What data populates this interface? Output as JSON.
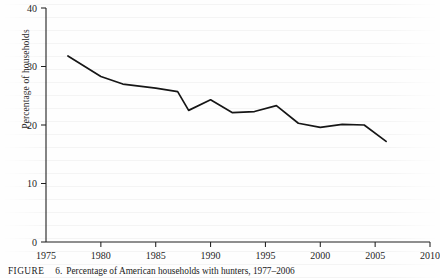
{
  "figure": {
    "caption_kicker": "FIGURE",
    "caption_number": "6.",
    "caption_text": "Percentage of American households with hunters, 1977–2006"
  },
  "chart_data": {
    "type": "line",
    "title": "",
    "subtitle": "",
    "xlabel": "",
    "ylabel": "Percentage of households",
    "xlim": [
      1975,
      2010
    ],
    "ylim": [
      0,
      40
    ],
    "grid": false,
    "legend": false,
    "legend_position": "none",
    "x_ticks": [
      "1975",
      "1980",
      "1985",
      "1990",
      "1995",
      "2000",
      "2005",
      "2010"
    ],
    "x_tick_values": [
      1975,
      1980,
      1985,
      1990,
      1995,
      2000,
      2005,
      2010
    ],
    "y_ticks": [
      "0",
      "10",
      "20",
      "30",
      "40"
    ],
    "y_tick_values": [
      0,
      10,
      20,
      30,
      40
    ],
    "series": [
      {
        "name": "Percentage of American households with hunters",
        "color": "#161616",
        "x": [
          1977,
          1980,
          1982,
          1985,
          1987,
          1988,
          1990,
          1992,
          1994,
          1996,
          1998,
          2000,
          2002,
          2004,
          2006
        ],
        "values": [
          31.8,
          28.3,
          27.0,
          26.3,
          25.7,
          22.5,
          24.3,
          22.1,
          22.3,
          23.3,
          20.3,
          19.6,
          20.1,
          20.0,
          17.2
        ]
      }
    ]
  }
}
